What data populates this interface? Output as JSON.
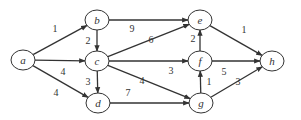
{
  "diagram": {
    "type": "directed-weighted-graph",
    "nodes": [
      {
        "id": "a",
        "label": "a",
        "x": 23,
        "y": 60
      },
      {
        "id": "b",
        "label": "b",
        "x": 97,
        "y": 20
      },
      {
        "id": "c",
        "label": "c",
        "x": 97,
        "y": 61
      },
      {
        "id": "d",
        "label": "d",
        "x": 98,
        "y": 103
      },
      {
        "id": "e",
        "label": "e",
        "x": 200,
        "y": 20
      },
      {
        "id": "f",
        "label": "f",
        "x": 200,
        "y": 61
      },
      {
        "id": "g",
        "label": "g",
        "x": 201,
        "y": 103
      },
      {
        "id": "h",
        "label": "h",
        "x": 272,
        "y": 61
      }
    ],
    "edges": [
      {
        "from": "a",
        "to": "b",
        "weight": "1",
        "lx": 55,
        "ly": 32
      },
      {
        "from": "a",
        "to": "c",
        "weight": "4",
        "lx": 63,
        "ly": 75
      },
      {
        "from": "a",
        "to": "d",
        "weight": "4",
        "lx": 56,
        "ly": 96
      },
      {
        "from": "b",
        "to": "c",
        "weight": "2",
        "lx": 88,
        "ly": 44
      },
      {
        "from": "b",
        "to": "e",
        "weight": "9",
        "lx": 132,
        "ly": 32
      },
      {
        "from": "c",
        "to": "d",
        "weight": "3",
        "lx": 88,
        "ly": 85
      },
      {
        "from": "c",
        "to": "e",
        "weight": "6",
        "lx": 151,
        "ly": 43
      },
      {
        "from": "c",
        "to": "f",
        "weight": "3",
        "lx": 171,
        "ly": 74
      },
      {
        "from": "c",
        "to": "g",
        "weight": "4",
        "lx": 142,
        "ly": 84
      },
      {
        "from": "d",
        "to": "g",
        "weight": "7",
        "lx": 128,
        "ly": 96
      },
      {
        "from": "f",
        "to": "e",
        "weight": "2",
        "lx": 193,
        "ly": 42
      },
      {
        "from": "f",
        "to": "h",
        "weight": "5",
        "lx": 224,
        "ly": 75
      },
      {
        "from": "g",
        "to": "f",
        "weight": "1",
        "lx": 209,
        "ly": 85
      },
      {
        "from": "e",
        "to": "h",
        "weight": "1",
        "lx": 244,
        "ly": 33
      },
      {
        "from": "g",
        "to": "h",
        "weight": "3",
        "lx": 238,
        "ly": 85
      }
    ]
  },
  "colors": {
    "stroke": "#333333",
    "background": "#ffffff"
  }
}
